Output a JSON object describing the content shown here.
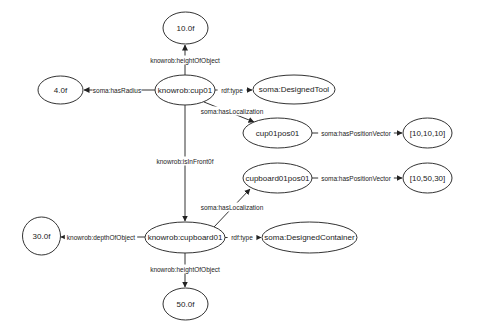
{
  "diagram": {
    "type": "rdf-knowledge-graph",
    "nodes": [
      {
        "id": "n_height_cup",
        "label": "10.0f",
        "cx": 185.5,
        "cy": 28,
        "rx": 22.5,
        "ry": 16
      },
      {
        "id": "n_radius",
        "label": "4.0f",
        "cx": 60.5,
        "cy": 90,
        "rx": 22.5,
        "ry": 14
      },
      {
        "id": "n_cup01",
        "label": "knowrob:cup01",
        "cx": 185,
        "cy": 90,
        "rx": 30,
        "ry": 15
      },
      {
        "id": "n_designed_tool",
        "label": "soma:DesignedTool",
        "cx": 294,
        "cy": 89.5,
        "rx": 41,
        "ry": 14.5
      },
      {
        "id": "n_cup01pos01",
        "label": "cup01pos01",
        "cx": 277.5,
        "cy": 133,
        "rx": 34.5,
        "ry": 15
      },
      {
        "id": "n_vec_cup",
        "label": "[10,10,10]",
        "cx": 427.5,
        "cy": 133,
        "rx": 24.5,
        "ry": 15
      },
      {
        "id": "n_cupboard01pos01",
        "label": "cupboard01pos01",
        "cx": 277.5,
        "cy": 178,
        "rx": 34.5,
        "ry": 15
      },
      {
        "id": "n_vec_cupboard",
        "label": "[10,50,30]",
        "cx": 427.5,
        "cy": 178,
        "rx": 24.5,
        "ry": 15
      },
      {
        "id": "n_depth",
        "label": "30.0f",
        "cx": 41.5,
        "cy": 236,
        "rx": 19,
        "ry": 19
      },
      {
        "id": "n_cupboard01",
        "label": "knowrob:cupboard01",
        "cx": 185,
        "cy": 237.5,
        "rx": 40,
        "ry": 15.5
      },
      {
        "id": "n_designed_container",
        "label": "soma:DesignedContainer",
        "cx": 309.5,
        "cy": 237.5,
        "rx": 47.5,
        "ry": 15.5
      },
      {
        "id": "n_height_cupboard",
        "label": "50.0f",
        "cx": 185.5,
        "cy": 304,
        "rx": 22.5,
        "ry": 16
      }
    ],
    "edges": [
      {
        "id": "e1",
        "from": "n_cup01",
        "to": "n_height_cup",
        "label": "knowrob:heightOfObject",
        "x1": 185,
        "y1": 75,
        "x2": 185,
        "y2": 45,
        "lx": 185,
        "ly": 60
      },
      {
        "id": "e2",
        "from": "n_cup01",
        "to": "n_radius",
        "label": "soma:hasRadius",
        "x1": 155,
        "y1": 90,
        "x2": 84,
        "y2": 90,
        "lx": 117,
        "ly": 90
      },
      {
        "id": "e3",
        "from": "n_cup01",
        "to": "n_designed_tool",
        "label": "rdf:type",
        "x1": 215,
        "y1": 90,
        "x2": 252,
        "y2": 90,
        "lx": 232,
        "ly": 90
      },
      {
        "id": "e4",
        "from": "n_cup01",
        "to": "n_cup01pos01",
        "label": "soma:hasLocalization",
        "x1": 204,
        "y1": 102,
        "x2": 254,
        "y2": 122,
        "lx": 232,
        "ly": 111
      },
      {
        "id": "e5",
        "from": "n_cup01pos01",
        "to": "n_vec_cup",
        "label": "soma:hasPositionVector",
        "x1": 312,
        "y1": 133,
        "x2": 402,
        "y2": 133,
        "lx": 356,
        "ly": 133
      },
      {
        "id": "e6",
        "from": "n_cup01",
        "to": "n_cupboard01",
        "label": "knowrob:isInFront0f",
        "x1": 185,
        "y1": 105,
        "x2": 185,
        "y2": 221,
        "lx": 185,
        "ly": 161
      },
      {
        "id": "e7",
        "from": "n_cupboard01",
        "to": "n_cupboard01pos01",
        "label": "soma:hasLocalization",
        "x1": 214,
        "y1": 227,
        "x2": 250,
        "y2": 189,
        "lx": 232,
        "ly": 207
      },
      {
        "id": "e8",
        "from": "n_cupboard01pos01",
        "to": "n_vec_cupboard",
        "label": "soma:hasPositionVector",
        "x1": 312,
        "y1": 178,
        "x2": 402,
        "y2": 178,
        "lx": 356,
        "ly": 178
      },
      {
        "id": "e9",
        "from": "n_cupboard01",
        "to": "n_depth",
        "label": "knowrob:depthOfObject",
        "x1": 145,
        "y1": 237,
        "x2": 61,
        "y2": 237,
        "lx": 101,
        "ly": 237
      },
      {
        "id": "e10",
        "from": "n_cupboard01",
        "to": "n_designed_container",
        "label": "rdf:type",
        "x1": 225,
        "y1": 237.5,
        "x2": 261,
        "y2": 237.5,
        "lx": 242,
        "ly": 237.5
      },
      {
        "id": "e11",
        "from": "n_cupboard01",
        "to": "n_height_cupboard",
        "label": "knowrob:heightOfObject",
        "x1": 185,
        "y1": 253,
        "x2": 185,
        "y2": 287,
        "lx": 185,
        "ly": 269
      }
    ]
  },
  "colors": {
    "stroke": "#333333",
    "text": "#222222",
    "background": "#ffffff"
  }
}
